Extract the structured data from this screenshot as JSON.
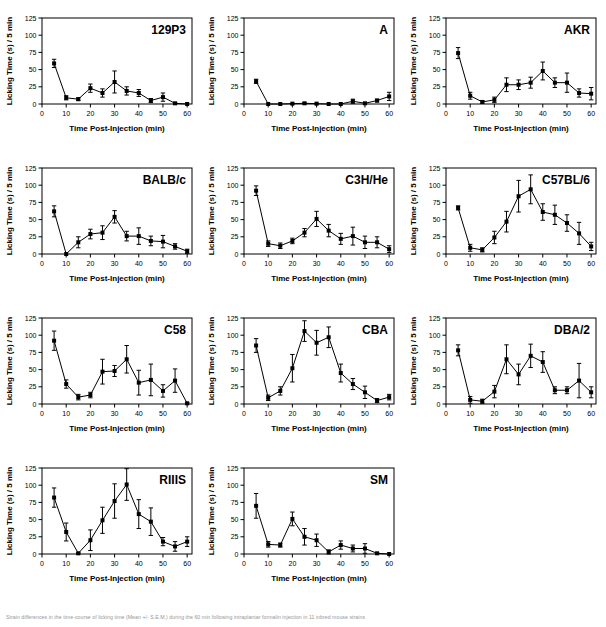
{
  "figure": {
    "panel_count": 11,
    "columns": 3,
    "rows": 4,
    "caption_fragment": "Strain differences in the time-course of licking time (Mean +/- S.E.M.) during the 60 min following intraplantar formalin injection in 11 inbred mouse strains"
  },
  "axes": {
    "xlabel": "Time Post-Injection (min)",
    "ylabel": "Licking Time (s) / 5 min",
    "xticks": [
      0,
      10,
      20,
      30,
      40,
      50,
      60
    ],
    "yticks": [
      0,
      25,
      50,
      75,
      100,
      125
    ],
    "xlim": [
      0,
      62
    ],
    "ylim": [
      0,
      125
    ],
    "xtick_labels": [
      "0",
      "10",
      "20",
      "30",
      "40",
      "50",
      "60"
    ],
    "ytick_labels": [
      "0",
      "25",
      "50",
      "75",
      "100",
      "125"
    ]
  },
  "style": {
    "line_color": "#000000",
    "marker_color": "#000000",
    "frame_color": "#000000",
    "background": "#ffffff",
    "marker": "square",
    "errorbar": "vertical-caps"
  },
  "chart_data": [
    {
      "type": "line",
      "title": "129P3",
      "xlabel": "Time Post-Injection (min)",
      "ylabel": "Licking Time (s) / 5 min",
      "xlim": [
        0,
        62
      ],
      "ylim": [
        0,
        125
      ],
      "grid": false,
      "legend": "none",
      "x": [
        5,
        10,
        15,
        20,
        25,
        30,
        35,
        40,
        45,
        50,
        55,
        60
      ],
      "values": [
        59,
        9,
        7,
        23,
        16,
        32,
        19,
        16,
        5,
        10,
        1,
        0
      ],
      "errors": [
        6,
        3,
        2,
        6,
        6,
        16,
        6,
        5,
        3,
        6,
        1,
        0
      ]
    },
    {
      "type": "line",
      "title": "A",
      "xlabel": "Time Post-Injection (min)",
      "ylabel": "Licking Time (s) / 5 min",
      "xlim": [
        0,
        62
      ],
      "ylim": [
        0,
        125
      ],
      "grid": false,
      "legend": "none",
      "x": [
        5,
        10,
        15,
        20,
        25,
        30,
        35,
        40,
        45,
        50,
        55,
        60
      ],
      "values": [
        33,
        0,
        0,
        0.5,
        1,
        0.5,
        0,
        0,
        4,
        1,
        5,
        11
      ],
      "errors": [
        3,
        0,
        0,
        0.5,
        1,
        0.5,
        0,
        0,
        3,
        1,
        2,
        6
      ]
    },
    {
      "type": "line",
      "title": "AKR",
      "xlabel": "Time Post-Injection (min)",
      "ylabel": "Licking Time (s) / 5 min",
      "xlim": [
        0,
        62
      ],
      "ylim": [
        0,
        125
      ],
      "grid": false,
      "legend": "none",
      "x": [
        5,
        10,
        15,
        20,
        25,
        30,
        35,
        40,
        45,
        50,
        55,
        60
      ],
      "values": [
        74,
        12,
        3,
        6,
        28,
        28,
        31,
        48,
        31,
        31,
        16,
        15
      ],
      "errors": [
        8,
        5,
        2,
        4,
        10,
        7,
        8,
        13,
        7,
        14,
        6,
        9
      ]
    },
    {
      "type": "line",
      "title": "BALB/c",
      "xlabel": "Time Post-Injection (min)",
      "ylabel": "Licking Time (s) / 5 min",
      "xlim": [
        0,
        62
      ],
      "ylim": [
        0,
        125
      ],
      "grid": false,
      "legend": "none",
      "x": [
        5,
        10,
        15,
        20,
        25,
        30,
        35,
        40,
        45,
        50,
        55,
        60
      ],
      "values": [
        62,
        0,
        17,
        29,
        31,
        54,
        26,
        26,
        19,
        18,
        11,
        4
      ],
      "errors": [
        8,
        0,
        8,
        7,
        10,
        9,
        7,
        12,
        7,
        9,
        4,
        3
      ]
    },
    {
      "type": "line",
      "title": "C3H/He",
      "xlabel": "Time Post-Injection (min)",
      "ylabel": "Licking Time (s) / 5 min",
      "xlim": [
        0,
        62
      ],
      "ylim": [
        0,
        125
      ],
      "grid": false,
      "legend": "none",
      "x": [
        5,
        10,
        15,
        20,
        25,
        30,
        35,
        40,
        45,
        50,
        55,
        60
      ],
      "values": [
        92,
        15,
        12,
        19,
        31,
        51,
        34,
        22,
        26,
        17,
        17,
        7
      ],
      "errors": [
        7,
        4,
        4,
        4,
        6,
        11,
        9,
        8,
        13,
        9,
        8,
        5
      ]
    },
    {
      "type": "line",
      "title": "C57BL/6",
      "xlabel": "Time Post-Injection (min)",
      "ylabel": "Licking Time (s) / 5 min",
      "xlim": [
        0,
        62
      ],
      "ylim": [
        0,
        125
      ],
      "grid": false,
      "legend": "none",
      "x": [
        5,
        10,
        15,
        20,
        25,
        30,
        35,
        40,
        45,
        50,
        55,
        60
      ],
      "values": [
        67,
        9,
        6,
        24,
        47,
        84,
        94,
        61,
        57,
        45,
        30,
        11
      ],
      "errors": [
        3,
        5,
        3,
        9,
        15,
        23,
        21,
        12,
        14,
        12,
        16,
        6
      ]
    },
    {
      "type": "line",
      "title": "C58",
      "xlabel": "Time Post-Injection (min)",
      "ylabel": "Licking Time (s) / 5 min",
      "xlim": [
        0,
        62
      ],
      "ylim": [
        0,
        125
      ],
      "grid": false,
      "legend": "none",
      "x": [
        5,
        10,
        15,
        20,
        25,
        30,
        35,
        40,
        45,
        50,
        55,
        60
      ],
      "values": [
        92,
        29,
        10,
        13,
        47,
        48,
        65,
        31,
        35,
        19,
        34,
        1
      ],
      "errors": [
        14,
        6,
        4,
        4,
        18,
        8,
        20,
        18,
        23,
        9,
        17,
        1
      ]
    },
    {
      "type": "line",
      "title": "CBA",
      "xlabel": "Time Post-Injection (min)",
      "ylabel": "Licking Time (s) / 5 min",
      "xlim": [
        0,
        62
      ],
      "ylim": [
        0,
        125
      ],
      "grid": false,
      "legend": "none",
      "x": [
        5,
        10,
        15,
        20,
        25,
        30,
        35,
        40,
        45,
        50,
        55,
        60
      ],
      "values": [
        85,
        9,
        19,
        52,
        106,
        89,
        97,
        45,
        29,
        17,
        5,
        10
      ],
      "errors": [
        10,
        4,
        6,
        20,
        15,
        18,
        15,
        13,
        8,
        9,
        3,
        4
      ]
    },
    {
      "type": "line",
      "title": "DBA/2",
      "xlabel": "Time Post-Injection (min)",
      "ylabel": "Licking Time (s) / 5 min",
      "xlim": [
        0,
        62
      ],
      "ylim": [
        0,
        125
      ],
      "grid": false,
      "legend": "none",
      "x": [
        5,
        10,
        15,
        20,
        25,
        30,
        35,
        40,
        45,
        50,
        55,
        60
      ],
      "values": [
        78,
        6,
        4,
        18,
        65,
        43,
        70,
        61,
        20,
        20,
        34,
        17
      ],
      "errors": [
        8,
        5,
        3,
        9,
        21,
        15,
        17,
        15,
        5,
        5,
        25,
        8
      ]
    },
    {
      "type": "line",
      "title": "RIIIS",
      "xlabel": "Time Post-Injection (min)",
      "ylabel": "Licking Time (s) / 5 min",
      "xlim": [
        0,
        62
      ],
      "ylim": [
        0,
        125
      ],
      "grid": false,
      "legend": "none",
      "x": [
        5,
        10,
        15,
        20,
        25,
        30,
        35,
        40,
        45,
        50,
        55,
        60
      ],
      "values": [
        82,
        32,
        1,
        20,
        49,
        77,
        101,
        58,
        47,
        18,
        11,
        18
      ],
      "errors": [
        14,
        13,
        1,
        15,
        19,
        25,
        23,
        21,
        20,
        6,
        7,
        7
      ]
    },
    {
      "type": "line",
      "title": "SM",
      "xlabel": "Time Post-Injection (min)",
      "ylabel": "Licking Time (s) / 5 min",
      "xlim": [
        0,
        62
      ],
      "ylim": [
        0,
        125
      ],
      "grid": false,
      "legend": "none",
      "x": [
        5,
        10,
        15,
        20,
        25,
        30,
        35,
        40,
        45,
        50,
        55,
        60
      ],
      "values": [
        70,
        14,
        13,
        51,
        25,
        20,
        3,
        13,
        8,
        8,
        1,
        0
      ],
      "errors": [
        18,
        4,
        3,
        10,
        12,
        9,
        3,
        6,
        5,
        7,
        1,
        0
      ]
    }
  ]
}
